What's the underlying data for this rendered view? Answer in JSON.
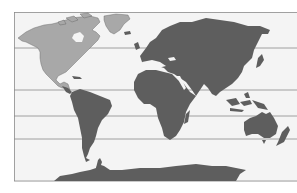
{
  "map": {
    "type": "world-map",
    "projection": "equirectangular (Pacific-cropped, Americas left)",
    "colors": {
      "background": "#ffffff",
      "ocean": "#f4f4f4",
      "highlight_land": "#a8a8a8",
      "land": "#5e5e5e",
      "lines": "#8a8a8a",
      "border": "#9a9a9a"
    },
    "highlighted_region": "North America and Greenland",
    "latitude_lines": [
      "Arctic Circle",
      "Tropic of Cancer",
      "Equator",
      "Tropic of Capricorn",
      "Antarctic Circle"
    ],
    "regions": [
      {
        "name": "North America",
        "highlighted": true
      },
      {
        "name": "Greenland",
        "highlighted": true
      },
      {
        "name": "South America",
        "highlighted": false
      },
      {
        "name": "Europe",
        "highlighted": false
      },
      {
        "name": "Africa",
        "highlighted": false
      },
      {
        "name": "Asia",
        "highlighted": false
      },
      {
        "name": "Australia",
        "highlighted": false
      },
      {
        "name": "Antarctica",
        "highlighted": false
      }
    ]
  }
}
